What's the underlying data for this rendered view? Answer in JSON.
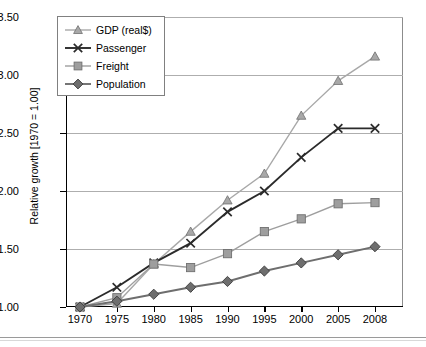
{
  "chart_data": {
    "type": "line",
    "title": "",
    "xlabel": "",
    "ylabel": "Relative growth [1970 = 1.00]",
    "categories": [
      "1970",
      "1975",
      "1980",
      "1985",
      "1990",
      "1995",
      "2000",
      "2005",
      "2008"
    ],
    "ylim": [
      1.0,
      3.5
    ],
    "yticks": [
      "1.00",
      "1.50",
      "2.00",
      "2.50",
      "3.00",
      "3.50"
    ],
    "ytick_values": [
      1.0,
      1.5,
      2.0,
      2.5,
      3.0,
      3.5
    ],
    "grid": "horizontal",
    "legend_position": "top-left inside plot",
    "series": [
      {
        "name": "GDP (real$)",
        "marker": "triangle",
        "color": "#a8a8a8",
        "values": [
          1.0,
          1.03,
          1.37,
          1.65,
          1.92,
          2.15,
          2.65,
          2.95,
          3.16
        ]
      },
      {
        "name": "Passenger",
        "marker": "x",
        "color": "#2b2b2b",
        "values": [
          1.0,
          1.17,
          1.38,
          1.55,
          1.82,
          2.0,
          2.29,
          2.54,
          2.54
        ]
      },
      {
        "name": "Freight",
        "marker": "square",
        "color": "#9e9e9e",
        "values": [
          1.0,
          1.08,
          1.37,
          1.34,
          1.46,
          1.65,
          1.76,
          1.89,
          1.9
        ]
      },
      {
        "name": "Population",
        "marker": "diamond",
        "color": "#6e6e6e",
        "values": [
          1.0,
          1.05,
          1.11,
          1.17,
          1.22,
          1.31,
          1.38,
          1.45,
          1.52
        ]
      }
    ]
  },
  "legend": {
    "items": [
      {
        "label": "GDP (real$)"
      },
      {
        "label": "Passenger"
      },
      {
        "label": "Freight"
      },
      {
        "label": "Population"
      }
    ]
  }
}
